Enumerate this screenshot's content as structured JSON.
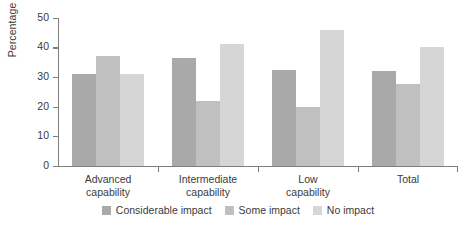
{
  "chart_data": {
    "type": "bar",
    "title": "",
    "subtitle": "",
    "xlabel": "",
    "ylabel": "Percentage",
    "categories": [
      "Advanced capability",
      "Intermediate capability",
      "Low capability",
      "Total"
    ],
    "category_lines": [
      [
        "Advanced",
        "capability"
      ],
      [
        "Intermediate",
        "capability"
      ],
      [
        "Low",
        "capability"
      ],
      [
        "Total",
        ""
      ]
    ],
    "series": [
      {
        "name": "Considerable impact",
        "color": "#a9a9a9",
        "values": [
          31,
          36.5,
          32.5,
          32
        ]
      },
      {
        "name": "Some impact",
        "color": "#c0c0c0",
        "values": [
          37,
          22,
          20,
          27.5
        ]
      },
      {
        "name": "No impact",
        "color": "#d6d6d6",
        "values": [
          31,
          41,
          46,
          40
        ]
      }
    ],
    "ylim": [
      0,
      50
    ],
    "yticks": [
      0,
      10,
      20,
      30,
      40,
      50
    ],
    "ytick_labels": [
      "0",
      "10",
      "20",
      "30",
      "40",
      "50"
    ],
    "grid": false,
    "legend_position": "bottom",
    "axis_color": "#7d7d7d",
    "text_color": "#3b3b3b",
    "background": "#ffffff"
  }
}
